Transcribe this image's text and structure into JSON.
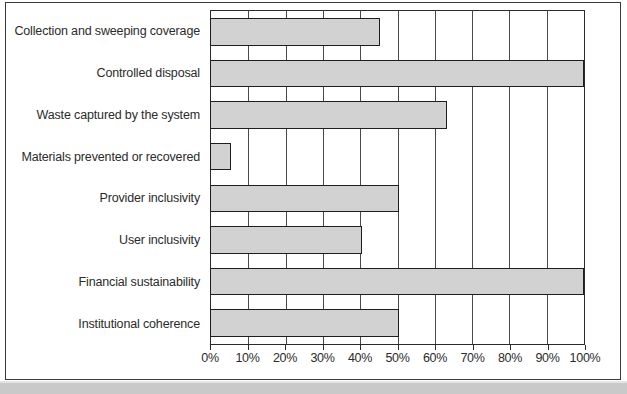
{
  "chart_data": {
    "type": "bar",
    "orientation": "horizontal",
    "title": "",
    "subtitle": "",
    "xlabel": "",
    "ylabel": "",
    "xlim": [
      0,
      100
    ],
    "grid": true,
    "legend": "none",
    "value_suffix": "%",
    "categories": [
      "Collection and sweeping coverage",
      "Controlled disposal",
      "Waste captured by the system",
      "Materials prevented or recovered",
      "Provider inclusivity",
      "User inclusivity",
      "Financial sustainability",
      "Institutional coherence"
    ],
    "values": [
      45,
      100,
      63,
      5,
      50,
      40,
      100,
      50
    ],
    "xticks": [
      0,
      10,
      20,
      30,
      40,
      50,
      60,
      70,
      80,
      90,
      100
    ],
    "xtick_labels": [
      "0%",
      "10%",
      "20%",
      "30%",
      "40%",
      "50%",
      "60%",
      "70%",
      "80%",
      "90%",
      "100%"
    ],
    "colors": {
      "bar_fill": "#d2d2d2",
      "bar_border": "#1e1e1e",
      "gridline": "#4a4a4a",
      "plot_border": "#2a2a2a",
      "text": "#2b2b2b",
      "background": "#ffffff",
      "page_strip": "#c9c9c9"
    }
  }
}
